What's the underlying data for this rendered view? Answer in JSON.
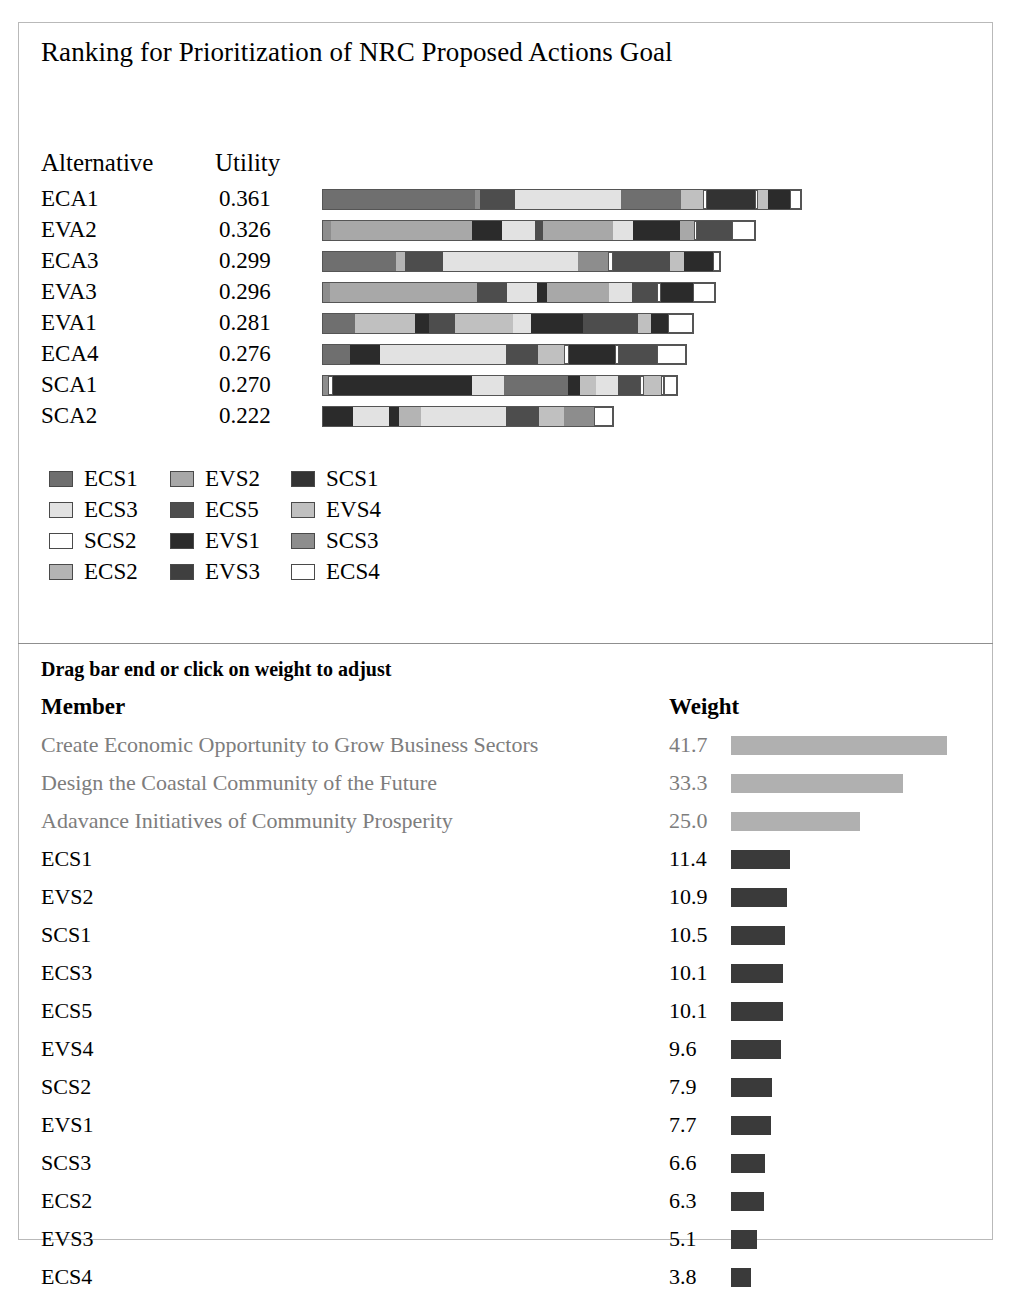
{
  "top_panel": {
    "title": "Ranking for Prioritization of NRC Proposed Actions Goal",
    "headers": {
      "alternative": "Alternative",
      "utility": "Utility"
    }
  },
  "bottom_panel": {
    "hint": "Drag bar end or click on weight to adjust",
    "headers": {
      "member": "Member",
      "weight": "Weight"
    }
  },
  "colors": {
    "ECS1": "#6f6f6f",
    "ECS3": "#e2e2e2",
    "SCS2": "#ffffff",
    "ECS2": "#b4b4b4",
    "EVS2": "#a8a8a8",
    "ECS5": "#4d4d4d",
    "EVS1": "#2b2b2b",
    "EVS3": "#3f3f3f",
    "SCS1": "#333333",
    "EVS4": "#c0c0c0",
    "SCS3": "#8d8d8d",
    "ECS4": "#ffffff",
    "goal_bar": "#b0b0b0",
    "member_bar": "#3a3a3a"
  },
  "legend": [
    [
      {
        "key": "ECS1",
        "label": "ECS1"
      },
      {
        "key": "EVS2",
        "label": "EVS2"
      },
      {
        "key": "SCS1",
        "label": "SCS1"
      }
    ],
    [
      {
        "key": "ECS3",
        "label": "ECS3"
      },
      {
        "key": "ECS5",
        "label": "ECS5"
      },
      {
        "key": "EVS4",
        "label": "EVS4"
      }
    ],
    [
      {
        "key": "SCS2",
        "label": "SCS2"
      },
      {
        "key": "EVS1",
        "label": "EVS1"
      },
      {
        "key": "SCS3",
        "label": "SCS3"
      }
    ],
    [
      {
        "key": "ECS2",
        "label": "ECS2"
      },
      {
        "key": "EVS3",
        "label": "EVS3"
      },
      {
        "key": "ECS4",
        "label": "ECS4"
      }
    ]
  ],
  "chart_data": {
    "type": "bar",
    "subtype": "stacked-horizontal",
    "title": "Ranking for Prioritization of NRC Proposed Actions Goal",
    "xlabel": "",
    "ylabel": "Alternative",
    "grid": false,
    "legend_position": "below",
    "categories": [
      "ECA1",
      "EVA2",
      "ECA3",
      "EVA3",
      "EVA1",
      "ECA4",
      "SCA1",
      "SCA2"
    ],
    "values": [
      0.361,
      0.326,
      0.299,
      0.296,
      0.281,
      0.276,
      0.27,
      0.222
    ],
    "value_labels": [
      "0.361",
      "0.326",
      "0.299",
      "0.296",
      "0.281",
      "0.276",
      "0.270",
      "0.222"
    ],
    "series_keys": [
      "ECS1",
      "EVS2",
      "SCS1",
      "ECS3",
      "ECS5",
      "EVS4",
      "SCS2",
      "EVS1",
      "SCS3",
      "ECS2",
      "EVS3",
      "ECS4"
    ],
    "rows": [
      {
        "alternative": "ECA1",
        "utility": "0.361",
        "total_px": 478,
        "segments": [
          {
            "key": "ECS1",
            "w": 152
          },
          {
            "key": "SCS3",
            "w": 5
          },
          {
            "key": "ECS5",
            "w": 35
          },
          {
            "key": "ECS3",
            "w": 106
          },
          {
            "key": "ECS1",
            "w": 60
          },
          {
            "key": "EVS4",
            "w": 22
          },
          {
            "key": "SCS2",
            "w": 4
          },
          {
            "key": "SCS1",
            "w": 48
          },
          {
            "key": "ECS4",
            "w": 3
          },
          {
            "key": "EVS4",
            "w": 10
          },
          {
            "key": "EVS1",
            "w": 22
          },
          {
            "key": "SCS2",
            "w": 11
          }
        ]
      },
      {
        "alternative": "EVA2",
        "utility": "0.326",
        "total_px": 432,
        "segments": [
          {
            "key": "SCS3",
            "w": 8
          },
          {
            "key": "EVS2",
            "w": 141
          },
          {
            "key": "EVS1",
            "w": 30
          },
          {
            "key": "ECS3",
            "w": 33
          },
          {
            "key": "ECS5",
            "w": 8
          },
          {
            "key": "EVS2",
            "w": 70
          },
          {
            "key": "ECS3",
            "w": 20
          },
          {
            "key": "EVS1",
            "w": 47
          },
          {
            "key": "EVS2",
            "w": 14
          },
          {
            "key": "SCS2",
            "w": 3
          },
          {
            "key": "ECS5",
            "w": 35
          },
          {
            "key": "ECS4",
            "w": 23
          }
        ]
      },
      {
        "alternative": "ECA3",
        "utility": "0.299",
        "total_px": 397,
        "segments": [
          {
            "key": "ECS1",
            "w": 73
          },
          {
            "key": "ECS2",
            "w": 9
          },
          {
            "key": "ECS5",
            "w": 38
          },
          {
            "key": "ECS3",
            "w": 135
          },
          {
            "key": "SCS3",
            "w": 30
          },
          {
            "key": "SCS2",
            "w": 5
          },
          {
            "key": "ECS5",
            "w": 57
          },
          {
            "key": "EVS4",
            "w": 14
          },
          {
            "key": "EVS1",
            "w": 29
          },
          {
            "key": "SCS2",
            "w": 7
          }
        ]
      },
      {
        "alternative": "EVA3",
        "utility": "0.296",
        "total_px": 392,
        "segments": [
          {
            "key": "SCS3",
            "w": 7
          },
          {
            "key": "EVS2",
            "w": 147
          },
          {
            "key": "ECS5",
            "w": 30
          },
          {
            "key": "ECS3",
            "w": 30
          },
          {
            "key": "EVS1",
            "w": 10
          },
          {
            "key": "EVS2",
            "w": 62
          },
          {
            "key": "ECS3",
            "w": 23
          },
          {
            "key": "ECS5",
            "w": 25
          },
          {
            "key": "SCS2",
            "w": 4
          },
          {
            "key": "EVS1",
            "w": 32
          },
          {
            "key": "ECS4",
            "w": 22
          }
        ]
      },
      {
        "alternative": "EVA1",
        "utility": "0.281",
        "total_px": 370,
        "segments": [
          {
            "key": "ECS1",
            "w": 32
          },
          {
            "key": "EVS4",
            "w": 60
          },
          {
            "key": "EVS1",
            "w": 14
          },
          {
            "key": "ECS5",
            "w": 26
          },
          {
            "key": "EVS4",
            "w": 58
          },
          {
            "key": "ECS3",
            "w": 18
          },
          {
            "key": "EVS1",
            "w": 52
          },
          {
            "key": "ECS5",
            "w": 55
          },
          {
            "key": "EVS4",
            "w": 13
          },
          {
            "key": "EVS1",
            "w": 17
          },
          {
            "key": "ECS4",
            "w": 25
          }
        ]
      },
      {
        "alternative": "ECA4",
        "utility": "0.276",
        "total_px": 363,
        "segments": [
          {
            "key": "ECS1",
            "w": 27
          },
          {
            "key": "EVS1",
            "w": 30
          },
          {
            "key": "ECS3",
            "w": 126
          },
          {
            "key": "ECS5",
            "w": 32
          },
          {
            "key": "EVS4",
            "w": 26
          },
          {
            "key": "SCS2",
            "w": 5
          },
          {
            "key": "EVS1",
            "w": 46
          },
          {
            "key": "SCS2",
            "w": 4
          },
          {
            "key": "ECS5",
            "w": 38
          },
          {
            "key": "ECS4",
            "w": 29
          }
        ]
      },
      {
        "alternative": "SCA1",
        "utility": "0.270",
        "total_px": 354,
        "segments": [
          {
            "key": "SCS3",
            "w": 5
          },
          {
            "key": "SCS2",
            "w": 5
          },
          {
            "key": "EVS1",
            "w": 139
          },
          {
            "key": "ECS3",
            "w": 32
          },
          {
            "key": "ECS1",
            "w": 64
          },
          {
            "key": "EVS1",
            "w": 12
          },
          {
            "key": "EVS4",
            "w": 16
          },
          {
            "key": "ECS3",
            "w": 22
          },
          {
            "key": "ECS5",
            "w": 22
          },
          {
            "key": "SCS2",
            "w": 4
          },
          {
            "key": "EVS4",
            "w": 17
          },
          {
            "key": "SCS2",
            "w": 3
          },
          {
            "key": "ECS4",
            "w": 13
          }
        ]
      },
      {
        "alternative": "SCA2",
        "utility": "0.222",
        "total_px": 290,
        "segments": [
          {
            "key": "EVS1",
            "w": 30
          },
          {
            "key": "ECS3",
            "w": 36
          },
          {
            "key": "EVS1",
            "w": 10
          },
          {
            "key": "ECS2",
            "w": 22
          },
          {
            "key": "ECS3",
            "w": 85
          },
          {
            "key": "ECS5",
            "w": 33
          },
          {
            "key": "EVS4",
            "w": 25
          },
          {
            "key": "SCS3",
            "w": 30
          },
          {
            "key": "ECS4",
            "w": 19
          }
        ]
      }
    ]
  },
  "weights": {
    "max": 41.7,
    "bar_max_px": 216,
    "rows": [
      {
        "member": "Create Economic Opportunity to Grow Business Sectors",
        "weight": "41.7",
        "value": 41.7,
        "kind": "goal"
      },
      {
        "member": "Design the Coastal Community of the Future",
        "weight": "33.3",
        "value": 33.3,
        "kind": "goal"
      },
      {
        "member": "Adavance Initiatives of Community Prosperity",
        "weight": "25.0",
        "value": 25.0,
        "kind": "goal"
      },
      {
        "member": "ECS1",
        "weight": "11.4",
        "value": 11.4,
        "kind": "member"
      },
      {
        "member": "EVS2",
        "weight": "10.9",
        "value": 10.9,
        "kind": "member"
      },
      {
        "member": "SCS1",
        "weight": "10.5",
        "value": 10.5,
        "kind": "member"
      },
      {
        "member": "ECS3",
        "weight": "10.1",
        "value": 10.1,
        "kind": "member"
      },
      {
        "member": "ECS5",
        "weight": "10.1",
        "value": 10.1,
        "kind": "member"
      },
      {
        "member": "EVS4",
        "weight": "9.6",
        "value": 9.6,
        "kind": "member"
      },
      {
        "member": "SCS2",
        "weight": "7.9",
        "value": 7.9,
        "kind": "member"
      },
      {
        "member": "EVS1",
        "weight": "7.7",
        "value": 7.7,
        "kind": "member"
      },
      {
        "member": "SCS3",
        "weight": "6.6",
        "value": 6.6,
        "kind": "member"
      },
      {
        "member": "ECS2",
        "weight": "6.3",
        "value": 6.3,
        "kind": "member"
      },
      {
        "member": "EVS3",
        "weight": "5.1",
        "value": 5.1,
        "kind": "member"
      },
      {
        "member": "ECS4",
        "weight": "3.8",
        "value": 3.8,
        "kind": "member"
      }
    ]
  }
}
